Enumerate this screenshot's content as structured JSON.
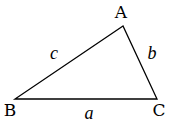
{
  "diagram": {
    "type": "triangle",
    "stroke_color": "#000000",
    "background": "#ffffff",
    "vertices": [
      {
        "name": "A",
        "x": 123,
        "y": 26,
        "label_x": 121,
        "label_y": 18
      },
      {
        "name": "B",
        "x": 15,
        "y": 99,
        "label_x": 10,
        "label_y": 116
      },
      {
        "name": "C",
        "x": 157,
        "y": 99,
        "label_x": 159,
        "label_y": 116
      }
    ],
    "sides": [
      {
        "name": "a",
        "between": "B-C",
        "label_x": 89,
        "label_y": 119
      },
      {
        "name": "b",
        "between": "A-C",
        "label_x": 152,
        "label_y": 59
      },
      {
        "name": "c",
        "between": "A-B",
        "label_x": 54,
        "label_y": 59
      }
    ]
  }
}
